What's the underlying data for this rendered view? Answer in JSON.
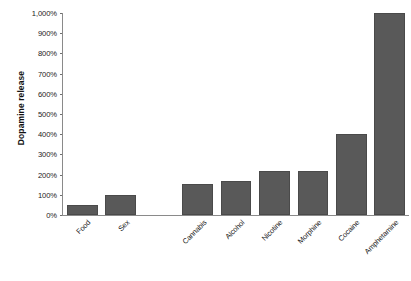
{
  "chart_data": {
    "type": "bar",
    "title": "",
    "xlabel": "",
    "ylabel": "Dopamine release",
    "categories": [
      "Food",
      "Sex",
      "Cannabis",
      "Alcohol",
      "Nicotine",
      "Morphine",
      "Cocaine",
      "Amphetamine"
    ],
    "values": [
      50,
      100,
      155,
      170,
      220,
      220,
      400,
      1000
    ],
    "value_unit": "%",
    "ylim": [
      0,
      1000
    ],
    "ytick_values": [
      0,
      100,
      200,
      300,
      400,
      500,
      600,
      700,
      800,
      900,
      1000
    ],
    "ytick_labels": [
      "0%",
      "100%",
      "200%",
      "300%",
      "400%",
      "500%",
      "600%",
      "700%",
      "800%",
      "900%",
      "1,000%"
    ],
    "grid": false,
    "legend": "none",
    "bar_color": "#595959",
    "bar_edge_color": "#4a4a4a",
    "axis_color": "#8a8a8a",
    "text_color": "#1a1a1a",
    "background_color": "#ffffff",
    "category_gap_after_index": 1
  }
}
